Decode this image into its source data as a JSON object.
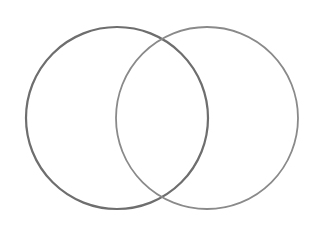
{
  "diagram": {
    "type": "venn",
    "style": "pencil-sketch",
    "background": "#ffffff",
    "sets": [
      {
        "id": "left",
        "cx": 117,
        "cy": 118,
        "r": 91,
        "stroke": "#6e6e6e",
        "stroke_width": 2.2
      },
      {
        "id": "right",
        "cx": 207,
        "cy": 118,
        "r": 91,
        "stroke": "#8a8a8a",
        "stroke_width": 1.8
      }
    ],
    "intersections": [
      {
        "x": 162,
        "y": 38
      },
      {
        "x": 162,
        "y": 198
      }
    ],
    "labels": []
  }
}
